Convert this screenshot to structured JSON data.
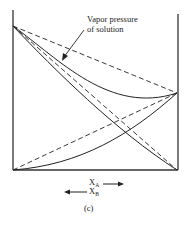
{
  "diagram": {
    "annotation": {
      "line1": "Vapor pressure",
      "line2": "of solution"
    },
    "axis": {
      "xa_label": "X",
      "xa_sub": "A",
      "xb_label": "X",
      "xb_sub": "B"
    },
    "caption": "(c)",
    "colors": {
      "line": "#222222",
      "background": "#ffffff"
    }
  }
}
